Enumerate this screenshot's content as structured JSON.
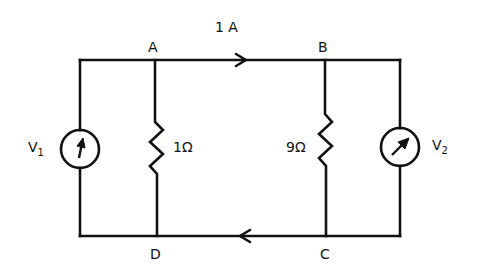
{
  "diagram": {
    "current_label": "1 A",
    "nodes": {
      "A": "A",
      "B": "B",
      "C": "C",
      "D": "D"
    },
    "resistors": [
      {
        "name": "R1",
        "value": "1Ω"
      },
      {
        "name": "R2",
        "value": "9Ω"
      }
    ],
    "meters": [
      {
        "name": "V",
        "sub": "1"
      },
      {
        "name": "V",
        "sub": "2"
      }
    ],
    "colors": {
      "line": "#111111",
      "background": "#ffffff"
    }
  }
}
